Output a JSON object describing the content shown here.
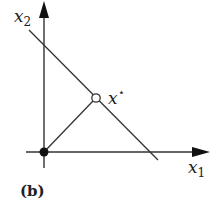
{
  "figure": {
    "panel_label": "(b)",
    "axes": {
      "x": {
        "name": "x",
        "subscript": "1"
      },
      "y": {
        "name": "x",
        "subscript": "2"
      }
    },
    "points": {
      "origin": {
        "style": "filled"
      },
      "optimum": {
        "name": "x",
        "superscript": "⋆",
        "style": "open"
      }
    },
    "colors": {
      "stroke": "#333333",
      "fill": "#111111"
    }
  }
}
